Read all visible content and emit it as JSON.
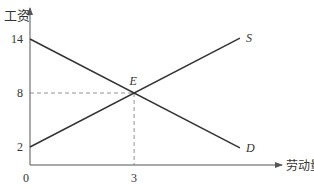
{
  "chart_data": {
    "type": "line",
    "title": "",
    "xlabel": "劳动量",
    "ylabel": "工资",
    "xlim": [
      0,
      6.3
    ],
    "ylim": [
      0,
      16
    ],
    "grid": false,
    "origin_label": "0",
    "x_ticks": [
      {
        "value": 3,
        "label": "3"
      }
    ],
    "y_ticks": [
      {
        "value": 14,
        "label": "14"
      },
      {
        "value": 8,
        "label": "8"
      },
      {
        "value": 2,
        "label": "2"
      }
    ],
    "series": [
      {
        "name": "S",
        "label": "S",
        "x": [
          0,
          6.05
        ],
        "y": [
          2,
          14.1
        ]
      },
      {
        "name": "D",
        "label": "D",
        "x": [
          0,
          6.05
        ],
        "y": [
          14,
          1.9
        ]
      }
    ],
    "annotations": [
      {
        "label": "E",
        "x": 3,
        "y": 8,
        "type": "equilibrium",
        "guides": "dashed"
      }
    ],
    "colors": {
      "line": "#333333",
      "axis": "#555555",
      "guide": "#777777"
    }
  }
}
